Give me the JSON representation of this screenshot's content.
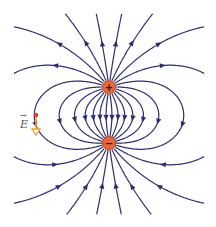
{
  "diagram": {
    "canvas": {
      "width": 216,
      "height": 227
    },
    "colors": {
      "field_line": "#2e2e6e",
      "charge_fill": "#e8663a",
      "charge_stroke": "#c04a22",
      "charge_symbol": "#222222",
      "vector": "#f2a23a",
      "vector_point": "#e53b2c",
      "background": "#ffffff"
    },
    "charges": [
      {
        "name": "positive-charge",
        "sign": "+",
        "x": 109,
        "y": 87,
        "r": 6.5
      },
      {
        "name": "negative-charge",
        "sign": "−",
        "x": 109,
        "y": 143,
        "r": 6.5
      }
    ],
    "field_lines": {
      "count": 22,
      "step": 0.6,
      "bounds": {
        "xmin": 14,
        "xmax": 204,
        "ymin": 14,
        "ymax": 214
      }
    },
    "e_vector": {
      "label": "E",
      "point": {
        "x": 36,
        "y": 115
      },
      "tip": {
        "x": 36,
        "y": 135
      },
      "label_pos": {
        "x": 20,
        "y": 124
      }
    }
  }
}
